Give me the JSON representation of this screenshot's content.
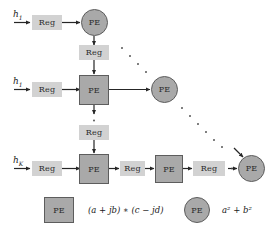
{
  "diagram": {
    "colors": {
      "pe_fill": "#a9a9a9",
      "pe_border": "#5d5d5d",
      "reg_fill": "#d2d2d2",
      "arrow": "#262626",
      "background": "#ffffff",
      "text": "#2b2b2b"
    },
    "labels": {
      "pe": "PE",
      "reg": "Reg"
    },
    "inputs": [
      {
        "id": "input-row-1",
        "text": "h",
        "sub": "1"
      },
      {
        "id": "input-row-2",
        "text": "h",
        "sub": "1"
      },
      {
        "id": "input-row-3",
        "text": "h",
        "sub": "K"
      }
    ],
    "rows": [
      {
        "id": "row-1",
        "input_label": "h1",
        "nodes": [
          "Reg",
          "PE"
        ],
        "pe_shape": "circle"
      },
      {
        "id": "row-2",
        "input_label": "h1",
        "nodes": [
          "Reg",
          "PE",
          "PE"
        ],
        "pe_shape": "square"
      },
      {
        "id": "row-3",
        "input_label": "hK",
        "nodes": [
          "Reg",
          "PE",
          "Reg",
          "PE",
          "Reg",
          "PE"
        ],
        "pe_shape": "square"
      }
    ],
    "vertical_regs": [
      {
        "id": "vreg-top",
        "label": "Reg"
      },
      {
        "id": "vreg-bottom",
        "label": "Reg"
      }
    ],
    "legend": [
      {
        "id": "legend-square",
        "shape": "square",
        "node_label": "PE",
        "formula": "(a + jb) ∗ (c − jd)"
      },
      {
        "id": "legend-circle",
        "shape": "circle",
        "node_label": "PE",
        "formula_base": "a",
        "formula": "a² + b²"
      }
    ]
  }
}
